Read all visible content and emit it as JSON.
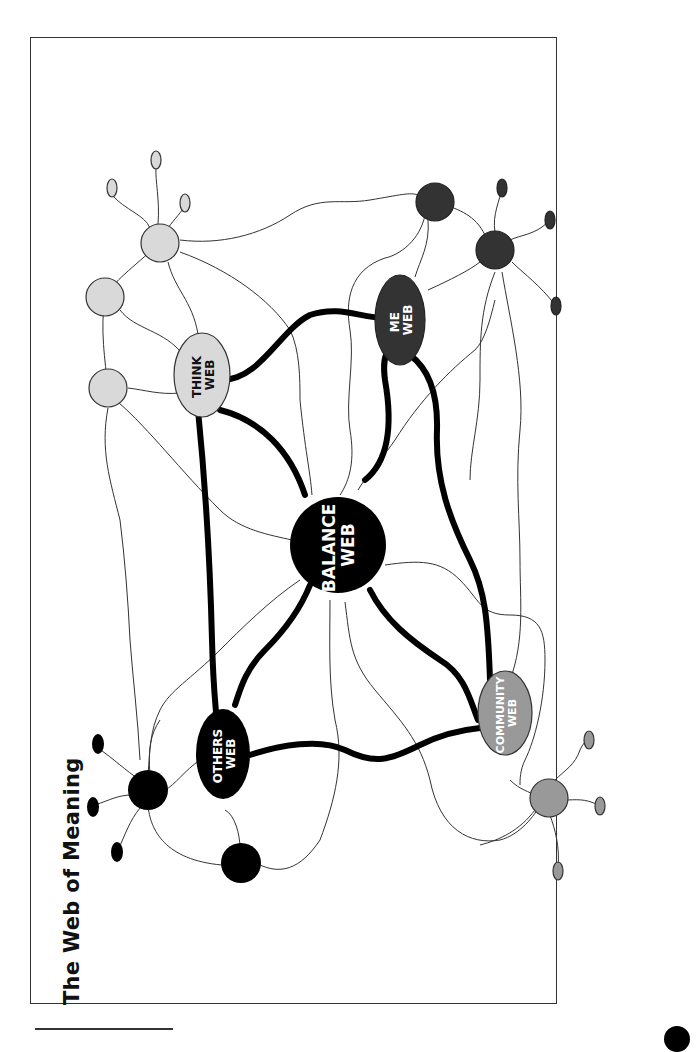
{
  "page": {
    "title": "The Web of Meaning"
  },
  "diagram": {
    "nodes": {
      "balance": {
        "line1": "BALANCE",
        "line2": "WEB",
        "fill": "#000000",
        "text": "#ffffff"
      },
      "think": {
        "line1": "THINK",
        "line2": "WEB",
        "fill": "#d9d9d9",
        "text": "#111111"
      },
      "me": {
        "line1": "ME",
        "line2": "WEB",
        "fill": "#333333",
        "text": "#ffffff"
      },
      "others": {
        "line1": "OTHERS",
        "line2": "WEB",
        "fill": "#000000",
        "text": "#ffffff"
      },
      "community": {
        "line1": "COMMUNITY",
        "line2": "WEB",
        "fill": "#999999",
        "text": "#ffffff"
      }
    },
    "colors": {
      "think_cluster": "#d9d9d9",
      "me_cluster": "#333333",
      "others_cluster": "#000000",
      "community_cluster": "#999999",
      "thin_line": "#333333",
      "thick_line": "#000000"
    }
  }
}
